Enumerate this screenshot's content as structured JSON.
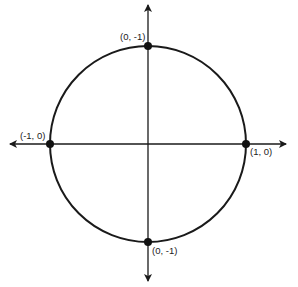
{
  "diagram": {
    "type": "unit-circle",
    "colors": {
      "stroke": "#1a1a1a",
      "point": "#111111",
      "background": "#ffffff"
    },
    "points": [
      {
        "id": "top",
        "label": "(0, -1)"
      },
      {
        "id": "left",
        "label": "(-1, 0)"
      },
      {
        "id": "right",
        "label": "(1, 0)"
      },
      {
        "id": "bottom",
        "label": "(0, -1)"
      }
    ]
  }
}
